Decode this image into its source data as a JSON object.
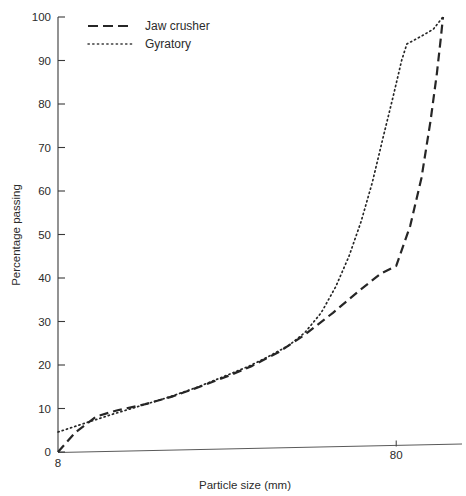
{
  "chart_data": {
    "type": "line",
    "title": "",
    "xlabel": "Particle size (mm)",
    "ylabel": "Percentage passing",
    "xscale": "log",
    "xlim": [
      8,
      110
    ],
    "ylim": [
      0,
      100
    ],
    "xticks": [
      8,
      80
    ],
    "xtick_labels": [
      "8",
      "80"
    ],
    "yticks": [
      0,
      10,
      20,
      30,
      40,
      50,
      60,
      70,
      80,
      90,
      100
    ],
    "ytick_labels": [
      "0",
      "10",
      "20",
      "30",
      "40",
      "50",
      "60",
      "70",
      "80",
      "90",
      "100"
    ],
    "grid": false,
    "legend_position": "top-left",
    "series": [
      {
        "name": "Jaw crusher",
        "style": "dashed",
        "color": "#262626",
        "points": [
          {
            "x": 8.0,
            "y": 0
          },
          {
            "x": 9.0,
            "y": 4.5
          },
          {
            "x": 10.4,
            "y": 8.2
          },
          {
            "x": 12.0,
            "y": 9.6
          },
          {
            "x": 14.5,
            "y": 11.0
          },
          {
            "x": 17.5,
            "y": 12.8
          },
          {
            "x": 21.0,
            "y": 15.0
          },
          {
            "x": 25.5,
            "y": 17.5
          },
          {
            "x": 30.0,
            "y": 19.8
          },
          {
            "x": 36.0,
            "y": 23.0
          },
          {
            "x": 43.0,
            "y": 27.0
          },
          {
            "x": 52.0,
            "y": 32.0
          },
          {
            "x": 62.0,
            "y": 37.0
          },
          {
            "x": 72.0,
            "y": 41.0
          },
          {
            "x": 80.0,
            "y": 42.8
          },
          {
            "x": 88.0,
            "y": 52.0
          },
          {
            "x": 95.0,
            "y": 63.0
          },
          {
            "x": 101.0,
            "y": 76.0
          },
          {
            "x": 105.5,
            "y": 87.0
          },
          {
            "x": 108.5,
            "y": 95.5
          },
          {
            "x": 110.0,
            "y": 100
          }
        ]
      },
      {
        "name": "Gyratory",
        "style": "dotted",
        "color": "#262626",
        "points": [
          {
            "x": 8.0,
            "y": 4.6
          },
          {
            "x": 9.5,
            "y": 6.5
          },
          {
            "x": 11.5,
            "y": 8.6
          },
          {
            "x": 14.0,
            "y": 10.6
          },
          {
            "x": 17.0,
            "y": 12.6
          },
          {
            "x": 20.5,
            "y": 14.8
          },
          {
            "x": 25.0,
            "y": 17.5
          },
          {
            "x": 29.5,
            "y": 19.8
          },
          {
            "x": 34.0,
            "y": 22.2
          },
          {
            "x": 38.5,
            "y": 24.5
          },
          {
            "x": 43.0,
            "y": 27.5
          },
          {
            "x": 48.0,
            "y": 32.0
          },
          {
            "x": 53.0,
            "y": 38.0
          },
          {
            "x": 58.0,
            "y": 45.0
          },
          {
            "x": 63.0,
            "y": 53.0
          },
          {
            "x": 68.0,
            "y": 62.0
          },
          {
            "x": 73.0,
            "y": 72.0
          },
          {
            "x": 78.5,
            "y": 82.0
          },
          {
            "x": 83.0,
            "y": 90.0
          },
          {
            "x": 86.0,
            "y": 93.8
          },
          {
            "x": 95.0,
            "y": 95.6
          },
          {
            "x": 103.0,
            "y": 97.2
          },
          {
            "x": 110.0,
            "y": 100
          }
        ]
      }
    ],
    "legend": [
      {
        "label": "Jaw crusher",
        "style": "dashed"
      },
      {
        "label": "Gyratory",
        "style": "dotted"
      }
    ]
  }
}
